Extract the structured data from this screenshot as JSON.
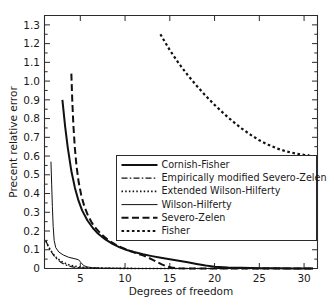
{
  "chart_data": {
    "type": "line",
    "title": "",
    "xlabel": "Degrees of freedom",
    "ylabel": "Precent relative error",
    "xlim": [
      1,
      31.5
    ],
    "ylim": [
      0,
      1.35
    ],
    "xticks": [
      5,
      10,
      15,
      20,
      25,
      30
    ],
    "xtick_labels": [
      "5",
      "10",
      "15",
      "20",
      "25",
      "30"
    ],
    "yticks": [
      0,
      0.1,
      0.2,
      0.3,
      0.4,
      0.5,
      0.6,
      0.7,
      0.8,
      0.9,
      1.0,
      1.1,
      1.2,
      1.3
    ],
    "ytick_labels": [
      "0",
      "0.1",
      "0.2",
      "0.3",
      "0.4",
      "0.5",
      "0.6",
      "0.7",
      "0.8",
      "0.9",
      "1.0",
      "1.1",
      "1.2",
      "1.3"
    ],
    "yminor_step": 0.05,
    "grid": false,
    "legend_position": "center-right-inside",
    "frame_color": "#2b2b2b",
    "series": [
      {
        "name": "Cornish-Fisher",
        "style": "solid-thick",
        "stroke_width": 2.0,
        "dash": "none",
        "points": [
          [
            3.0,
            0.9
          ],
          [
            3.3,
            0.76
          ],
          [
            3.6,
            0.645
          ],
          [
            4.0,
            0.52
          ],
          [
            4.4,
            0.43
          ],
          [
            4.8,
            0.362
          ],
          [
            5.2,
            0.31
          ],
          [
            5.8,
            0.256
          ],
          [
            6.4,
            0.216
          ],
          [
            7.0,
            0.185
          ],
          [
            7.8,
            0.155
          ],
          [
            8.6,
            0.131
          ],
          [
            9.4,
            0.113
          ],
          [
            10.2,
            0.099
          ],
          [
            11.0,
            0.088
          ],
          [
            12.0,
            0.076
          ],
          [
            13.0,
            0.066
          ],
          [
            14.0,
            0.057
          ],
          [
            15.0,
            0.049
          ],
          [
            16.0,
            0.041
          ],
          [
            17.0,
            0.033
          ],
          [
            18.0,
            0.024
          ],
          [
            19.0,
            0.016
          ],
          [
            20.0,
            0.01
          ],
          [
            21.5,
            0.006
          ],
          [
            23.0,
            0.004
          ],
          [
            25.0,
            0.002
          ],
          [
            27.0,
            0.001
          ],
          [
            29.0,
            0.0
          ],
          [
            31.0,
            0.0
          ]
        ]
      },
      {
        "name": "Empirically modified Severo-Zelen",
        "style": "dash-dot",
        "stroke_width": 1.2,
        "dash": "6,2.2,1.6,2.2",
        "points": [
          [
            1.15,
            0.148
          ],
          [
            1.4,
            0.12
          ],
          [
            1.7,
            0.094
          ],
          [
            2.0,
            0.072
          ],
          [
            2.3,
            0.055
          ],
          [
            2.6,
            0.042
          ],
          [
            2.9,
            0.031
          ],
          [
            3.2,
            0.023
          ],
          [
            3.6,
            0.015
          ],
          [
            4.0,
            0.01
          ],
          [
            4.5,
            0.006
          ],
          [
            5.0,
            0.004
          ],
          [
            6.0,
            0.002
          ],
          [
            7.5,
            0.001
          ],
          [
            10.0,
            0.0
          ],
          [
            15.0,
            0.0
          ],
          [
            20.0,
            0.0
          ],
          [
            25.0,
            0.0
          ],
          [
            31.0,
            0.0
          ]
        ]
      },
      {
        "name": "Extended Wilson-Hilferty",
        "style": "dotted-fine",
        "stroke_width": 1.6,
        "dash": "1.5,2.2",
        "points": [
          [
            1.15,
            0.146
          ],
          [
            1.5,
            0.112
          ],
          [
            1.9,
            0.082
          ],
          [
            2.3,
            0.06
          ],
          [
            2.7,
            0.044
          ],
          [
            3.1,
            0.032
          ],
          [
            3.5,
            0.024
          ],
          [
            4.0,
            0.016
          ],
          [
            4.6,
            0.01
          ],
          [
            5.2,
            0.006
          ],
          [
            6.0,
            0.004
          ],
          [
            7.0,
            0.002
          ],
          [
            9.0,
            0.001
          ],
          [
            12.0,
            0.0
          ],
          [
            18.0,
            0.0
          ],
          [
            25.0,
            0.0
          ],
          [
            31.0,
            0.0
          ]
        ]
      },
      {
        "name": "Wilson-Hilferty",
        "style": "solid-thin",
        "stroke_width": 1.0,
        "dash": "none",
        "points": [
          [
            1.72,
            0.57
          ],
          [
            1.8,
            0.45
          ],
          [
            1.88,
            0.33
          ],
          [
            1.97,
            0.225
          ],
          [
            2.08,
            0.15
          ],
          [
            2.25,
            0.112
          ],
          [
            2.6,
            0.088
          ],
          [
            3.1,
            0.072
          ],
          [
            3.7,
            0.06
          ],
          [
            4.3,
            0.053
          ],
          [
            4.8,
            0.047
          ],
          [
            5.1,
            0.03
          ],
          [
            5.4,
            0.015
          ],
          [
            5.8,
            0.008
          ],
          [
            6.4,
            0.004
          ],
          [
            7.4,
            0.002
          ],
          [
            9.0,
            0.001
          ],
          [
            12.0,
            0.0
          ],
          [
            18.0,
            0.0
          ],
          [
            25.0,
            0.0
          ],
          [
            31.0,
            0.0
          ]
        ]
      },
      {
        "name": "Severo-Zelen",
        "style": "dash-long",
        "stroke_width": 2.0,
        "dash": "7,3.5",
        "points": [
          [
            4.0,
            1.04
          ],
          [
            4.1,
            0.9
          ],
          [
            4.22,
            0.77
          ],
          [
            4.38,
            0.65
          ],
          [
            4.58,
            0.545
          ],
          [
            4.82,
            0.46
          ],
          [
            5.1,
            0.392
          ],
          [
            5.45,
            0.332
          ],
          [
            5.85,
            0.283
          ],
          [
            6.3,
            0.243
          ],
          [
            6.85,
            0.208
          ],
          [
            7.45,
            0.178
          ],
          [
            8.1,
            0.152
          ],
          [
            8.85,
            0.13
          ],
          [
            9.6,
            0.112
          ],
          [
            10.4,
            0.096
          ],
          [
            11.2,
            0.082
          ],
          [
            12.0,
            0.07
          ],
          [
            12.6,
            0.058
          ],
          [
            13.1,
            0.046
          ],
          [
            13.6,
            0.034
          ],
          [
            14.1,
            0.022
          ],
          [
            14.6,
            0.012
          ],
          [
            15.2,
            0.005
          ],
          [
            16.0,
            0.001
          ],
          [
            17.5,
            0.0
          ],
          [
            20.0,
            0.0
          ],
          [
            25.0,
            0.0
          ],
          [
            31.0,
            0.0
          ]
        ]
      },
      {
        "name": "Fisher",
        "style": "dash-medium",
        "stroke_width": 2.2,
        "dash": "2.6,2.6",
        "points": [
          [
            13.95,
            1.25
          ],
          [
            15.0,
            1.165
          ],
          [
            16.0,
            1.095
          ],
          [
            17.0,
            1.032
          ],
          [
            18.0,
            0.975
          ],
          [
            19.0,
            0.922
          ],
          [
            20.0,
            0.873
          ],
          [
            21.0,
            0.828
          ],
          [
            22.0,
            0.786
          ],
          [
            23.0,
            0.748
          ],
          [
            24.0,
            0.714
          ],
          [
            25.0,
            0.684
          ],
          [
            26.0,
            0.66
          ],
          [
            27.0,
            0.64
          ],
          [
            28.0,
            0.625
          ],
          [
            29.0,
            0.614
          ],
          [
            30.0,
            0.606
          ],
          [
            30.6,
            0.604
          ]
        ]
      }
    ]
  },
  "legend": {
    "entries": [
      {
        "label": "Cornish-Fisher"
      },
      {
        "label": "Empirically modified Severo-Zelen"
      },
      {
        "label": "Extended Wilson-Hilferty"
      },
      {
        "label": "Wilson-Hilferty"
      },
      {
        "label": "Severo-Zelen"
      },
      {
        "label": "Fisher"
      }
    ]
  }
}
